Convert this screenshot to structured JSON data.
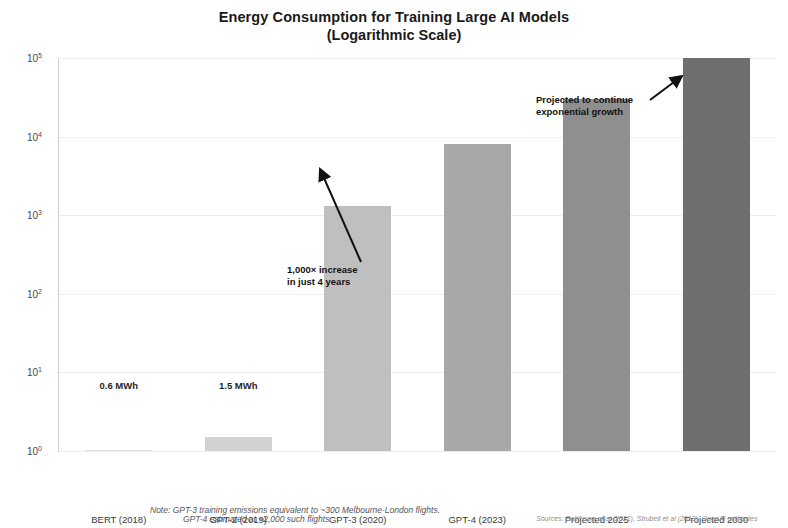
{
  "chart_data": {
    "type": "bar",
    "title": "Energy Consumption for Training Large AI Models",
    "subtitle": "(Logarithmic Scale)",
    "xlabel": "",
    "ylabel": "Energy Consumption (MWh, log scale)",
    "scale": "log10",
    "ylim": [
      1,
      100000
    ],
    "grid": true,
    "legend": "none",
    "categories": [
      "BERT (2018)",
      "GPT-2 (2019)",
      "GPT-3 (2020)",
      "GPT-4 (2023)",
      "Projected 2025",
      "Projected 2030"
    ],
    "values": [
      0.6,
      1.5,
      1300,
      8000,
      30000,
      100000
    ],
    "bar_colors": [
      "#e3e3e3",
      "#d2d2d2",
      "#bfbfbf",
      "#a8a8a8",
      "#8f8f8f",
      "#6f6f6f"
    ],
    "ytick_labels": [
      "10^0",
      "10^1",
      "10^2",
      "10^3",
      "10^4",
      "10^5"
    ],
    "ytick_mantissa": [
      "10",
      "10",
      "10",
      "10",
      "10",
      "10"
    ],
    "ytick_exponents": [
      "0",
      "1",
      "2",
      "3",
      "4",
      "5"
    ],
    "value_labels": [
      {
        "category": "BERT (2018)",
        "text": "0.6 MWh"
      },
      {
        "category": "GPT-2 (2019)",
        "text": "1.5 MWh"
      }
    ],
    "annotations": [
      {
        "id": "growth-rate",
        "line1": "1,000× increase",
        "line2": "in just 4 years",
        "points_to": "GPT-3 (2020)"
      },
      {
        "id": "projection",
        "line1": "Projected to continue",
        "line2": "exponential growth",
        "points_to": "Projected 2030"
      }
    ],
    "footnotes": {
      "note_line1": "Note: GPT-3 training emissions equivalent to ~300 Melbourne-London flights.",
      "note_line2": "GPT-4 estimated at ~2,000 such flights.",
      "sources": "Sources: Patterson et al (2021), Strubell et al (2019), OpenAI estimates"
    }
  }
}
